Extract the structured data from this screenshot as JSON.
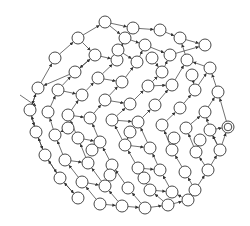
{
  "diagram": {
    "type": "state-graph",
    "colors": {
      "stroke": "#333333",
      "fill": "#ffffff",
      "background": "#ffffff"
    },
    "node_radius": 6,
    "start_arrow": {
      "from": [
        20,
        95
      ],
      "to": [
        36,
        106
      ]
    },
    "accepting_node": {
      "x": 228,
      "y": 127
    },
    "nodes": [
      [
        105,
        22
      ],
      [
        133,
        28
      ],
      [
        160,
        30
      ],
      [
        180,
        38
      ],
      [
        205,
        45
      ],
      [
        125,
        38
      ],
      [
        145,
        45
      ],
      [
        170,
        55
      ],
      [
        78,
        38
      ],
      [
        95,
        55
      ],
      [
        117,
        60
      ],
      [
        137,
        62
      ],
      [
        162,
        72
      ],
      [
        187,
        60
      ],
      [
        210,
        68
      ],
      [
        55,
        58
      ],
      [
        75,
        72
      ],
      [
        98,
        78
      ],
      [
        122,
        82
      ],
      [
        148,
        86
      ],
      [
        172,
        85
      ],
      [
        195,
        90
      ],
      [
        218,
        92
      ],
      [
        38,
        88
      ],
      [
        58,
        90
      ],
      [
        82,
        95
      ],
      [
        105,
        100
      ],
      [
        130,
        104
      ],
      [
        155,
        105
      ],
      [
        180,
        108
      ],
      [
        205,
        112
      ],
      [
        30,
        110
      ],
      [
        48,
        112
      ],
      [
        68,
        115
      ],
      [
        90,
        118
      ],
      [
        112,
        120
      ],
      [
        138,
        122
      ],
      [
        162,
        125
      ],
      [
        186,
        128
      ],
      [
        210,
        130
      ],
      [
        36,
        132
      ],
      [
        55,
        135
      ],
      [
        78,
        138
      ],
      [
        100,
        142
      ],
      [
        125,
        145
      ],
      [
        150,
        148
      ],
      [
        172,
        150
      ],
      [
        196,
        152
      ],
      [
        220,
        150
      ],
      [
        45,
        155
      ],
      [
        65,
        160
      ],
      [
        88,
        163
      ],
      [
        112,
        165
      ],
      [
        138,
        168
      ],
      [
        160,
        170
      ],
      [
        185,
        172
      ],
      [
        208,
        170
      ],
      [
        60,
        178
      ],
      [
        82,
        182
      ],
      [
        105,
        186
      ],
      [
        128,
        188
      ],
      [
        150,
        190
      ],
      [
        172,
        192
      ],
      [
        195,
        190
      ],
      [
        78,
        198
      ],
      [
        100,
        204
      ],
      [
        122,
        206
      ],
      [
        145,
        208
      ],
      [
        168,
        205
      ],
      [
        188,
        200
      ],
      [
        118,
        50
      ],
      [
        152,
        58
      ],
      [
        192,
        75
      ],
      [
        68,
        128
      ],
      [
        130,
        132
      ],
      [
        174,
        138
      ],
      [
        200,
        140
      ],
      [
        92,
        150
      ],
      [
        144,
        178
      ],
      [
        110,
        175
      ]
    ],
    "edges": [
      [
        0,
        1
      ],
      [
        1,
        2
      ],
      [
        2,
        3
      ],
      [
        3,
        4
      ],
      [
        0,
        5
      ],
      [
        5,
        6
      ],
      [
        6,
        7
      ],
      [
        7,
        4
      ],
      [
        8,
        0
      ],
      [
        8,
        9
      ],
      [
        9,
        10
      ],
      [
        10,
        5
      ],
      [
        11,
        6
      ],
      [
        12,
        7
      ],
      [
        13,
        3
      ],
      [
        14,
        13
      ],
      [
        15,
        8
      ],
      [
        16,
        9
      ],
      [
        17,
        10
      ],
      [
        18,
        11
      ],
      [
        19,
        12
      ],
      [
        20,
        13
      ],
      [
        21,
        14
      ],
      [
        22,
        14
      ],
      [
        23,
        15
      ],
      [
        24,
        16
      ],
      [
        25,
        17
      ],
      [
        26,
        18
      ],
      [
        27,
        19
      ],
      [
        28,
        20
      ],
      [
        29,
        21
      ],
      [
        30,
        22
      ],
      [
        31,
        23
      ],
      [
        32,
        24
      ],
      [
        33,
        25
      ],
      [
        34,
        26
      ],
      [
        35,
        27
      ],
      [
        36,
        28
      ],
      [
        37,
        29
      ],
      [
        38,
        30
      ],
      [
        39,
        30
      ],
      [
        40,
        31
      ],
      [
        41,
        32
      ],
      [
        42,
        33
      ],
      [
        43,
        34
      ],
      [
        44,
        35
      ],
      [
        45,
        36
      ],
      [
        46,
        37
      ],
      [
        47,
        38
      ],
      [
        48,
        39
      ],
      [
        49,
        40
      ],
      [
        50,
        41
      ],
      [
        51,
        42
      ],
      [
        52,
        43
      ],
      [
        53,
        44
      ],
      [
        54,
        45
      ],
      [
        55,
        46
      ],
      [
        56,
        47
      ],
      [
        57,
        49
      ],
      [
        58,
        50
      ],
      [
        59,
        51
      ],
      [
        60,
        52
      ],
      [
        61,
        53
      ],
      [
        62,
        54
      ],
      [
        63,
        55
      ],
      [
        64,
        57
      ],
      [
        65,
        58
      ],
      [
        66,
        59
      ],
      [
        67,
        60
      ],
      [
        68,
        61
      ],
      [
        69,
        62
      ],
      [
        1,
        70
      ],
      [
        70,
        11
      ],
      [
        71,
        12
      ],
      [
        72,
        21
      ],
      [
        73,
        41
      ],
      [
        74,
        44
      ],
      [
        75,
        46
      ],
      [
        76,
        47
      ],
      [
        77,
        43
      ],
      [
        78,
        53
      ],
      [
        79,
        52
      ],
      [
        24,
        25
      ],
      [
        33,
        34
      ],
      [
        42,
        43
      ],
      [
        50,
        51
      ],
      [
        58,
        59
      ],
      [
        65,
        66
      ],
      [
        66,
        67
      ],
      [
        67,
        68
      ],
      [
        68,
        69
      ],
      [
        69,
        63
      ],
      [
        63,
        56
      ],
      [
        56,
        48
      ],
      [
        48,
        39
      ],
      [
        19,
        20
      ],
      [
        26,
        27
      ],
      [
        35,
        36
      ],
      [
        44,
        45
      ],
      [
        53,
        54
      ],
      [
        61,
        62
      ],
      [
        17,
        18
      ],
      [
        9,
        16
      ],
      [
        16,
        23
      ],
      [
        23,
        31
      ],
      [
        31,
        40
      ],
      [
        40,
        49
      ],
      [
        49,
        57
      ],
      [
        57,
        64
      ]
    ]
  }
}
